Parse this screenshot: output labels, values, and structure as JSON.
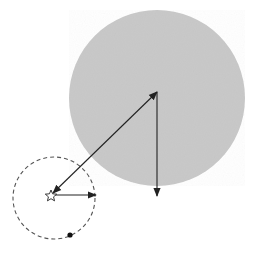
{
  "diagram": {
    "width": 257,
    "height": 254,
    "background": "#ffffff",
    "stroke_color": "#222222",
    "large_body": {
      "cx": 157,
      "cy": 98,
      "r": 88,
      "fill": "#c9c9c9"
    },
    "orbit": {
      "cx": 54,
      "cy": 198,
      "r": 41,
      "dash": "4 3",
      "stroke": "#555555"
    },
    "star": {
      "x": 51,
      "y": 196,
      "size": 6
    },
    "small_body": {
      "cx": 70,
      "cy": 235,
      "r": 2.6
    },
    "arrows": [
      {
        "id": "separation-vector",
        "x1": 157,
        "y1": 92,
        "x2": 53,
        "y2": 193,
        "double": true
      },
      {
        "id": "vertical-vector",
        "x1": 157,
        "y1": 92,
        "x2": 157,
        "y2": 196,
        "double": false
      },
      {
        "id": "star-velocity-vector",
        "x1": 55,
        "y1": 195,
        "x2": 96,
        "y2": 195,
        "double": false
      }
    ]
  }
}
